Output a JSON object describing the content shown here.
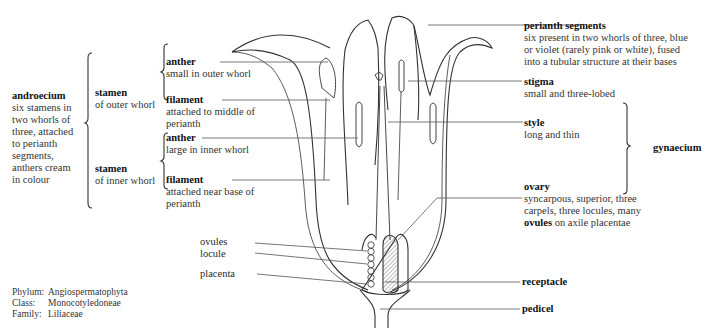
{
  "diagram": {
    "type": "botanical-section"
  },
  "groups": {
    "androecium": {
      "title": "androecium",
      "desc": [
        "six stamens in",
        "two whorls of",
        "three, attached",
        "to perianth",
        "segments,",
        "anthers cream",
        "in colour"
      ]
    },
    "stamen_outer": {
      "title": "stamen",
      "desc": "of outer whorl"
    },
    "stamen_inner": {
      "title": "stamen",
      "desc": "of inner whorl"
    },
    "gynaecium": {
      "title": "gynaecium"
    }
  },
  "labels": {
    "anther_outer": {
      "title": "anther",
      "desc": [
        "small in outer whorl"
      ]
    },
    "filament_outer": {
      "title": "filament",
      "desc": [
        "attached to middle of",
        "perianth"
      ]
    },
    "anther_inner": {
      "title": "anther",
      "desc": [
        "large in inner whorl"
      ]
    },
    "filament_inner": {
      "title": "filament",
      "desc": [
        "attached near base of",
        "perianth"
      ]
    },
    "perianth": {
      "title": "perianth segments",
      "desc": [
        "six present in two whorls of three, blue",
        "or violet (rarely pink or white), fused",
        "into a tubular structure at their bases"
      ]
    },
    "stigma": {
      "title": "stigma",
      "desc": [
        "small and three-lobed"
      ]
    },
    "style": {
      "title": "style",
      "desc": [
        "long and thin"
      ]
    },
    "ovary": {
      "title": "ovary",
      "desc": [
        "syncarpous, superior, three",
        "carpels, three locules, many"
      ],
      "desc_last_bold": "ovules",
      "desc_last_rest": " on axile placentae"
    },
    "ovules": "ovules",
    "locule": "locule",
    "placenta": "placenta",
    "receptacle": "receptacle",
    "pedicel": "pedicel"
  },
  "taxonomy": [
    {
      "key": "Phylum:",
      "value": "Angiospermatophyta"
    },
    {
      "key": "Class:",
      "value": "Monocotyledoneae"
    },
    {
      "key": "Family:",
      "value": "Liliaceae"
    }
  ]
}
